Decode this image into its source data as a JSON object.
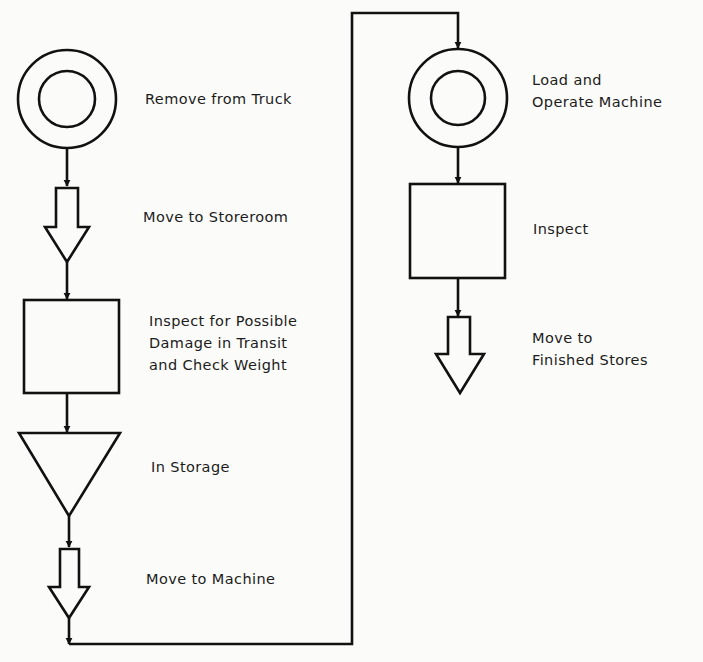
{
  "diagram": {
    "type": "flow-process-chart",
    "colors": {
      "stroke": "#111111",
      "background": "#fbfbf9",
      "text": "#1c1c1c"
    },
    "steps": [
      {
        "id": 1,
        "symbol": "operation",
        "icon": "double-circle-icon",
        "label": "Remove from Truck"
      },
      {
        "id": 2,
        "symbol": "transportation",
        "icon": "block-arrow-down-icon",
        "label": "Move to Storeroom"
      },
      {
        "id": 3,
        "symbol": "inspection",
        "icon": "square-icon",
        "label": "Inspect for Possible\nDamage in Transit\nand Check Weight"
      },
      {
        "id": 4,
        "symbol": "storage",
        "icon": "inverted-triangle-icon",
        "label": "In Storage"
      },
      {
        "id": 5,
        "symbol": "transportation",
        "icon": "block-arrow-down-icon",
        "label": "Move to Machine"
      },
      {
        "id": 6,
        "symbol": "operation",
        "icon": "double-circle-icon",
        "label": "Load and\nOperate Machine"
      },
      {
        "id": 7,
        "symbol": "inspection",
        "icon": "square-icon",
        "label": "Inspect"
      },
      {
        "id": 8,
        "symbol": "transportation",
        "icon": "block-arrow-down-icon",
        "label": "Move to\nFinished Stores"
      }
    ]
  }
}
